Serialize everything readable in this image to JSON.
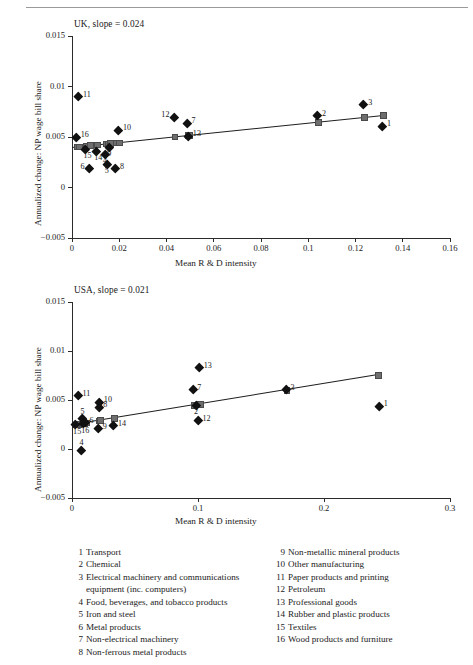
{
  "axis_titles": {
    "x": "Mean R & D intensity",
    "y": "Annualized change: NP wage bill share"
  },
  "panels": [
    {
      "id": "uk",
      "title": "UK, slope = 0.024",
      "xticks": [
        "0",
        "0.02",
        "0.04",
        "0.06",
        "0.08",
        "0.1",
        "0.12",
        "0.14",
        "0.16"
      ],
      "yticks": [
        "0.015",
        "0.01",
        "0.005",
        "0",
        "-0.005"
      ]
    },
    {
      "id": "usa",
      "title": "USA, slope = 0.021",
      "xticks": [
        "0",
        "0.1",
        "0.2",
        "0.3"
      ],
      "yticks": [
        "0.015",
        "0.01",
        "0.005",
        "0",
        "-0.005"
      ]
    }
  ],
  "legend": {
    "left": [
      {
        "num": "1",
        "label": "Transport"
      },
      {
        "num": "2",
        "label": "Chemical"
      },
      {
        "num": "3",
        "label": "Electrical machinery and communications",
        "cont": "equipment (inc. computers)"
      },
      {
        "num": "4",
        "label": "Food, beverages, and tobacco products"
      },
      {
        "num": "5",
        "label": "Iron and steel"
      },
      {
        "num": "6",
        "label": "Metal products"
      },
      {
        "num": "7",
        "label": "Non-electrical machinery"
      },
      {
        "num": "8",
        "label": "Non-ferrous metal products"
      }
    ],
    "right": [
      {
        "num": "9",
        "label": "Non-metallic mineral products"
      },
      {
        "num": "10",
        "label": "Other manufacturing"
      },
      {
        "num": "11",
        "label": "Paper products and printing"
      },
      {
        "num": "12",
        "label": "Petroleum"
      },
      {
        "num": "13",
        "label": "Professional goods"
      },
      {
        "num": "14",
        "label": "Rubber and plastic products"
      },
      {
        "num": "15",
        "label": "Textiles"
      },
      {
        "num": "16",
        "label": "Wood products and furniture"
      }
    ]
  },
  "chart_data": [
    {
      "type": "scatter",
      "id": "uk",
      "title": "UK, slope = 0.024",
      "xlabel": "Mean R & D intensity",
      "ylabel": "Annualized change: NP wage bill share",
      "xlim": [
        0,
        0.16
      ],
      "ylim": [
        -0.005,
        0.015
      ],
      "xtick_values": [
        0,
        0.02,
        0.04,
        0.06,
        0.08,
        0.1,
        0.12,
        0.14,
        0.16
      ],
      "ytick_values": [
        -0.005,
        0,
        0.005,
        0.01,
        0.015
      ],
      "grid": false,
      "legend_position": "below-figure",
      "slope": 0.024,
      "intercept": 0.00405,
      "fit_line": {
        "x": [
          0,
          0.132
        ],
        "y": [
          0.00405,
          0.00722
        ]
      },
      "points": [
        {
          "label": "1",
          "industry": "Transport",
          "x": 0.1315,
          "y": 0.0061,
          "label_side": "right"
        },
        {
          "label": "2",
          "industry": "Chemical",
          "x": 0.104,
          "y": 0.0071,
          "label_side": "right"
        },
        {
          "label": "3",
          "industry": "Electrical machinery and communications equipment (inc. computers)",
          "x": 0.1235,
          "y": 0.0082,
          "label_side": "right"
        },
        {
          "label": "4",
          "industry": "Food, beverages, and tobacco products",
          "x": 0.014,
          "y": 0.0033,
          "label_side": "below"
        },
        {
          "label": "5",
          "industry": "Iron and steel",
          "x": 0.0148,
          "y": 0.0023,
          "label_side": "below"
        },
        {
          "label": "6",
          "industry": "Metal products",
          "x": 0.0073,
          "y": 0.0019,
          "label_side": "left"
        },
        {
          "label": "7",
          "industry": "Non-electrical machinery",
          "x": 0.0487,
          "y": 0.0064,
          "label_side": "right"
        },
        {
          "label": "8",
          "industry": "Non-ferrous metal products",
          "x": 0.0185,
          "y": 0.0019,
          "label_side": "right"
        },
        {
          "label": "9",
          "industry": "Non-metallic mineral products",
          "x": 0.0158,
          "y": 0.004,
          "label_side": "below"
        },
        {
          "label": "10",
          "industry": "Other manufacturing",
          "x": 0.0197,
          "y": 0.0057,
          "label_side": "right"
        },
        {
          "label": "11",
          "industry": "Paper products and printing",
          "x": 0.0028,
          "y": 0.009,
          "label_side": "right"
        },
        {
          "label": "12",
          "industry": "Petroleum",
          "x": 0.0432,
          "y": 0.007,
          "label_side": "left"
        },
        {
          "label": "13",
          "industry": "Professional goods",
          "x": 0.0493,
          "y": 0.0051,
          "label_side": "right"
        },
        {
          "label": "14",
          "industry": "Rubber and plastic products",
          "x": 0.0103,
          "y": 0.0036,
          "label_side": "below"
        },
        {
          "label": "15",
          "industry": "Textiles",
          "x": 0.0058,
          "y": 0.0038,
          "label_side": "below"
        },
        {
          "label": "16",
          "industry": "Wood products and furniture",
          "x": 0.0018,
          "y": 0.005,
          "label_side": "right"
        }
      ],
      "fitted_markers": [
        {
          "x": 0.0018,
          "y": 0.00409
        },
        {
          "x": 0.0028,
          "y": 0.00412
        },
        {
          "x": 0.0058,
          "y": 0.00419
        },
        {
          "x": 0.0073,
          "y": 0.00423
        },
        {
          "x": 0.0103,
          "y": 0.0043
        },
        {
          "x": 0.014,
          "y": 0.00439
        },
        {
          "x": 0.0148,
          "y": 0.00441
        },
        {
          "x": 0.0158,
          "y": 0.00443
        },
        {
          "x": 0.0185,
          "y": 0.0045
        },
        {
          "x": 0.0197,
          "y": 0.00452
        },
        {
          "x": 0.0432,
          "y": 0.00509
        },
        {
          "x": 0.0487,
          "y": 0.00522
        },
        {
          "x": 0.0493,
          "y": 0.00523
        },
        {
          "x": 0.104,
          "y": 0.00655
        },
        {
          "x": 0.1235,
          "y": 0.00701
        },
        {
          "x": 0.1315,
          "y": 0.00721
        }
      ]
    },
    {
      "type": "scatter",
      "id": "usa",
      "title": "USA, slope = 0.021",
      "xlabel": "Mean R & D intensity",
      "ylabel": "Annualized change: NP wage bill share",
      "xlim": [
        0,
        0.3
      ],
      "ylim": [
        -0.005,
        0.015
      ],
      "xtick_values": [
        0,
        0.1,
        0.2,
        0.3
      ],
      "ytick_values": [
        -0.005,
        0,
        0.005,
        0.01,
        0.015
      ],
      "grid": false,
      "legend_position": "below-figure",
      "slope": 0.021,
      "intercept": 0.00252,
      "fit_line": {
        "x": [
          0,
          0.2425
        ],
        "y": [
          0.00252,
          0.00761
        ]
      },
      "points": [
        {
          "label": "1",
          "industry": "Transport",
          "x": 0.244,
          "y": 0.0044,
          "label_side": "right"
        },
        {
          "label": "2",
          "industry": "Chemical",
          "x": 0.0985,
          "y": 0.0045,
          "label_side": "below"
        },
        {
          "label": "3",
          "industry": "Electrical machinery and communications equipment (inc. computers)",
          "x": 0.17,
          "y": 0.0061,
          "label_side": "right"
        },
        {
          "label": "4",
          "industry": "Food, beverages, and tobacco products",
          "x": 0.0072,
          "y": -0.0001,
          "label_side": "above"
        },
        {
          "label": "5",
          "industry": "Iron and steel",
          "x": 0.008,
          "y": 0.0031,
          "label_side": "above"
        },
        {
          "label": "6",
          "industry": "Metal products",
          "x": 0.0105,
          "y": 0.0027,
          "label_side": "right"
        },
        {
          "label": "7",
          "industry": "Non-electrical machinery",
          "x": 0.096,
          "y": 0.0061,
          "label_side": "right"
        },
        {
          "label": "8",
          "industry": "Non-ferrous metal products",
          "x": 0.0213,
          "y": 0.0043,
          "label_side": "right"
        },
        {
          "label": "9",
          "industry": "Non-metallic mineral products",
          "x": 0.021,
          "y": 0.0021,
          "label_side": "right"
        },
        {
          "label": "10",
          "industry": "Other manufacturing",
          "x": 0.0218,
          "y": 0.0048,
          "label_side": "right"
        },
        {
          "label": "11",
          "industry": "Paper products and printing",
          "x": 0.0048,
          "y": 0.0055,
          "label_side": "right"
        },
        {
          "label": "12",
          "industry": "Petroleum",
          "x": 0.1,
          "y": 0.0029,
          "label_side": "right"
        },
        {
          "label": "13",
          "industry": "Professional goods",
          "x": 0.101,
          "y": 0.0083,
          "label_side": "right"
        },
        {
          "label": "14",
          "industry": "Rubber and plastic products",
          "x": 0.033,
          "y": 0.0024,
          "label_side": "right"
        },
        {
          "label": "15",
          "industry": "Textiles",
          "x": 0.0026,
          "y": 0.0025,
          "label_side": "below"
        },
        {
          "label": "16",
          "industry": "Wood products and furniture",
          "x": 0.009,
          "y": 0.0026,
          "label_side": "below"
        }
      ],
      "fitted_markers": [
        {
          "x": 0.0026,
          "y": 0.00257
        },
        {
          "x": 0.0048,
          "y": 0.00262
        },
        {
          "x": 0.0072,
          "y": 0.00267
        },
        {
          "x": 0.008,
          "y": 0.00269
        },
        {
          "x": 0.009,
          "y": 0.00271
        },
        {
          "x": 0.0105,
          "y": 0.00274
        },
        {
          "x": 0.021,
          "y": 0.00296
        },
        {
          "x": 0.0213,
          "y": 0.00297
        },
        {
          "x": 0.0218,
          "y": 0.00298
        },
        {
          "x": 0.033,
          "y": 0.00321
        },
        {
          "x": 0.096,
          "y": 0.00454
        },
        {
          "x": 0.0985,
          "y": 0.00459
        },
        {
          "x": 0.1,
          "y": 0.00462
        },
        {
          "x": 0.101,
          "y": 0.00464
        },
        {
          "x": 0.17,
          "y": 0.00609
        },
        {
          "x": 0.2425,
          "y": 0.00761
        }
      ]
    }
  ]
}
